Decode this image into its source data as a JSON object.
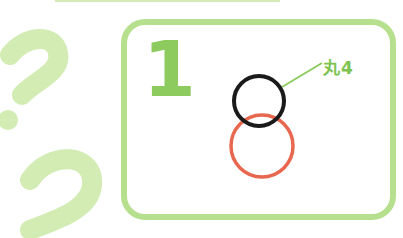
{
  "step": {
    "number": "1"
  },
  "callout": {
    "label": "丸4"
  },
  "colors": {
    "card_border": "#b6e08e",
    "step_number": "#8dcb5e",
    "callout_text": "#7cc350",
    "callout_line": "#8dcb5e",
    "head_circle": "#1a1a1a",
    "body_circle": "#e8684f",
    "question_marks": "#d2ecb4"
  },
  "shapes": {
    "head_circle": {
      "cx": 259,
      "cy": 101,
      "r": 25
    },
    "body_circle": {
      "cx": 262,
      "cy": 146,
      "r": 31
    }
  }
}
